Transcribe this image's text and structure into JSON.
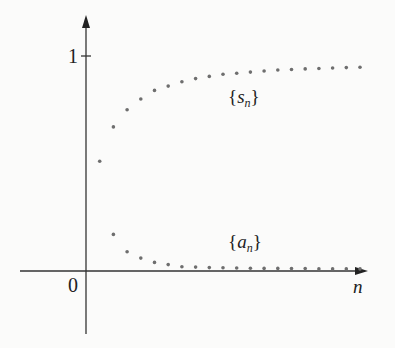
{
  "chart_data": {
    "type": "scatter",
    "title": "",
    "xlabel": "n",
    "ylabel": "",
    "x_origin_label": "0",
    "y_ticks": [
      {
        "value": 1,
        "label": "1"
      }
    ],
    "grid": false,
    "series": [
      {
        "name": "{s_n}",
        "label": "{sn}",
        "x": [
          1,
          2,
          3,
          4,
          5,
          6,
          7,
          8,
          9,
          10,
          11,
          12,
          13,
          14,
          15,
          16,
          17,
          18,
          19,
          20
        ],
        "values": [
          0.51,
          0.67,
          0.75,
          0.8,
          0.84,
          0.86,
          0.88,
          0.895,
          0.905,
          0.915,
          0.92,
          0.925,
          0.93,
          0.935,
          0.937,
          0.94,
          0.942,
          0.944,
          0.946,
          0.948
        ]
      },
      {
        "name": "{a_n}",
        "label": "{an}",
        "x": [
          2,
          3,
          4,
          5,
          6,
          7,
          8,
          9,
          10,
          11,
          12,
          13,
          14,
          15,
          16,
          17,
          18,
          19,
          20
        ],
        "values": [
          0.17,
          0.09,
          0.06,
          0.04,
          0.03,
          0.02,
          0.018,
          0.016,
          0.015,
          0.014,
          0.013,
          0.012,
          0.012,
          0.011,
          0.011,
          0.01,
          0.01,
          0.01,
          0.01
        ]
      }
    ]
  },
  "labels": {
    "y_tick_one": "1",
    "origin": "0",
    "x_axis": "n",
    "s_brace_open": "{",
    "s_var": "s",
    "s_sub": "n",
    "s_brace_close": "}",
    "a_brace_open": "{",
    "a_var": "a",
    "a_sub": "n",
    "a_brace_close": "}"
  },
  "colors": {
    "axis": "#333333",
    "dot": "#6e6e6e"
  }
}
